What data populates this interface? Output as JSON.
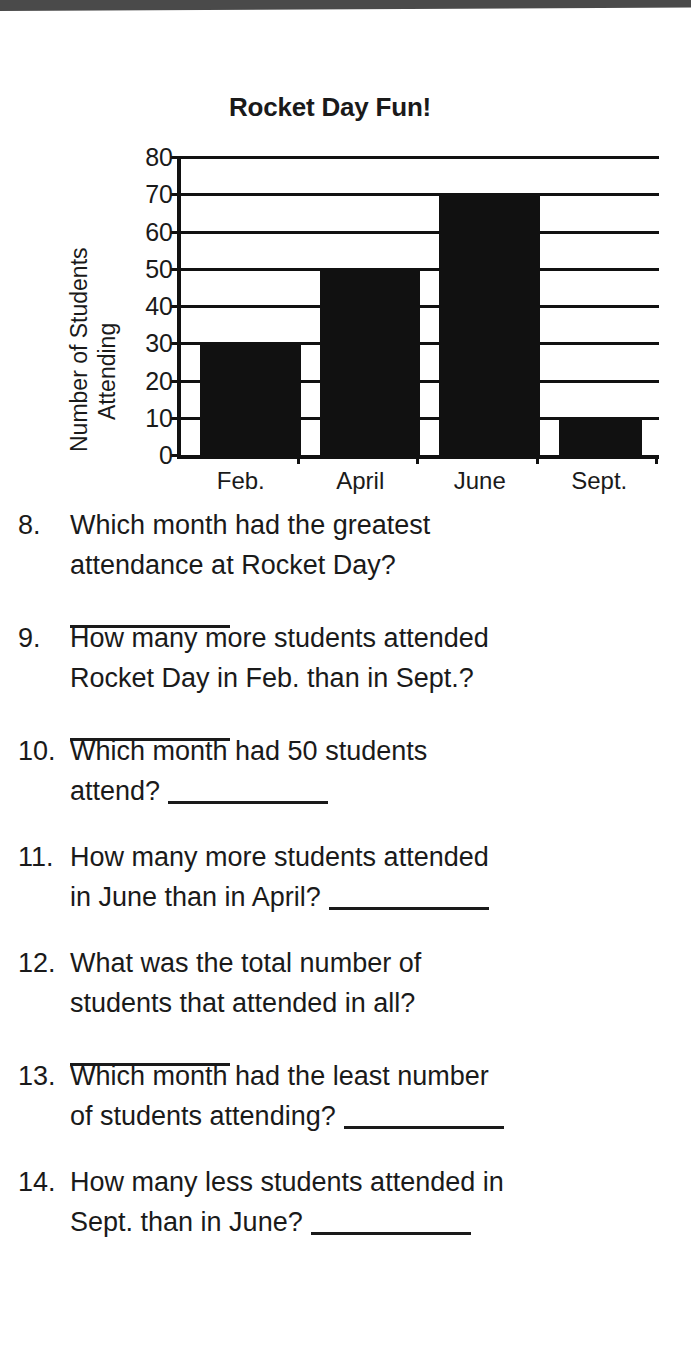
{
  "page": {
    "scan_band": "top-scan-edge",
    "ink_color": "#1a1a1a"
  },
  "chart_data": {
    "type": "bar",
    "title": "Rocket Day Fun!",
    "categories": [
      "Feb.",
      "April",
      "June",
      "Sept."
    ],
    "values": [
      30,
      50,
      70,
      10
    ],
    "xlabel": "",
    "ylabel_lines": [
      "Number of Students",
      "Attending"
    ],
    "ylim": [
      0,
      80
    ],
    "ytick_step": 10,
    "yticks": [
      0,
      10,
      20,
      30,
      40,
      50,
      60,
      70,
      80
    ],
    "ytick_labels": [
      "0",
      "10",
      "20",
      "30",
      "40",
      "50",
      "60",
      "70",
      "80"
    ],
    "grid": true,
    "legend": "none",
    "bar_color": "#111111"
  },
  "questions": [
    {
      "number": "8.",
      "lines": [
        "Which month had the greatest",
        "attendance at Rocket Day?"
      ],
      "blank_style": "row"
    },
    {
      "number": "9.",
      "lines": [
        "How many more students attended",
        "Rocket Day in Feb. than in Sept.?"
      ],
      "blank_style": "row"
    },
    {
      "number": "10.",
      "lines": [
        "Which month had 50 students",
        "attend?"
      ],
      "blank_style": "inline"
    },
    {
      "number": "11.",
      "lines": [
        "How many more students attended",
        "in June than in April?"
      ],
      "blank_style": "inline"
    },
    {
      "number": "12.",
      "lines": [
        "What was the total number of",
        "students that attended in all?"
      ],
      "blank_style": "row"
    },
    {
      "number": "13.",
      "lines": [
        "Which month had the least number",
        "of students attending?"
      ],
      "blank_style": "inline"
    },
    {
      "number": "14.",
      "lines": [
        "How many less students attended in",
        "Sept. than in June?"
      ],
      "blank_style": "inline"
    }
  ]
}
